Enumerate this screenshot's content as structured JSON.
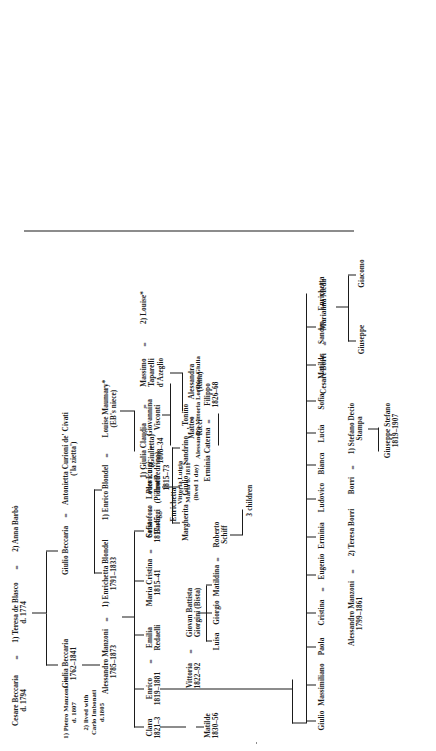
{
  "generations": {
    "g1": {
      "cesare_beccaria": "Cesare Beccaria\nd. 1794",
      "eq1": "=",
      "teresa_de_blasco": "1) Teresa de Blasco\nd. 1774",
      "eq2": "=",
      "anna_barbo": "2) Anna Barbò"
    },
    "g2": {
      "pietro_manzoni": "1) Pietro Manzoni\nd. 1807",
      "pietro_manzoni_note": "2) lived with\nCarlo Imbonati\nd.1805",
      "giulia_beccaria": "Giulia Beccaria\n1762–1841",
      "giulio_beccaria": "Giulio Beccaria",
      "eq_giulio": "=",
      "antonietta_curioni": "Antonietta Curioni de' Civati\n('la zietta')"
    },
    "g3": {
      "alessandro_manzoni": "Alessandro Manzoni\n1785–1873",
      "eq_a1": "=",
      "enrichetta_blondel": "1) Enrichetta Blondel\n1791–1833",
      "enrico_blondel": "1) Enrico Blondel",
      "eq_enrico": "=",
      "louise_maumary": "Louise Maumary*\n(EB's niece)",
      "alessandro_manzoni_2": "Alessandro Manzoni\n1799–1861",
      "eq_a2": "=",
      "teresa_borri": "2) Teresa Borri"
    },
    "g4_manzoni_children": [
      {
        "name": "Clara",
        "dates": "1821–3"
      },
      {
        "name": "Enrico",
        "dates": "1819–1881",
        "eq": "=",
        "spouse": "Emilia\nRedaelli"
      },
      {
        "name": "Maria Cristina",
        "dates": "1815–41",
        "eq": "=",
        "spouse": "Cristoforo\nBaroggi"
      },
      {
        "name": "Pier Luigi",
        "dates": "(Pietro/Pedrino)\n1815–73",
        "eq": "=",
        "spouse": "Giovannina\nVisconti"
      },
      {
        "name": "Sofia",
        "dates": "1817–45",
        "eq": "=",
        "spouse": "Lodovico\nTrotti"
      }
    ],
    "g4_other": {
      "vittoria": "Vittoria\n1822–92",
      "eq_vittoria": "=",
      "giovan_battista": "Giovan Battista\nGiorgini (Bista)",
      "matilde": "Matilde\n1830–56",
      "giulia_claudia": "1) Giulia Claudia\n(Giulietta)\n1808–34",
      "eq_giulia": "=",
      "massimo": "Massimo\nTaparelli\nd'Azeglio",
      "eq_massimo": "=",
      "louise": "2) Louise*",
      "vittoria_luigia": "Vittoria Luigia\nMaria b. 1811\n(lived 1 day)"
    },
    "g5": {
      "luisa": "Luisa",
      "giorgio": "Giorgio",
      "matildina": "Matildina",
      "eq_matildina": "=",
      "roberto_schiff": "Roberto\nSchiff",
      "three_children": "3 children",
      "erminia_caterna": "Erminia Caterna",
      "eq_filippo": "=",
      "filippo": "Filippo\n1826–68",
      "margherita": "Margherita",
      "giulio": "Giulio",
      "sandrino": "Sandrino",
      "tonino": ", Tonino",
      "enrichetta_mid": "Enrichetta",
      "alessandra_vittoria": "Alessandra Vittoria Lorenzo Giulia",
      "alessandra_rina": "Alessandra\n(Rina)",
      "matteo_ricci": "Matteo\nRicci",
      "eq_matteo": "="
    },
    "g6_enrico_children": [
      "Giulio",
      "Massimiliano",
      "Paola",
      "Cristina",
      "Erminia",
      "Ludovico",
      "Bianca",
      "Lucia",
      "Sofia",
      "Matilde",
      "Sandro",
      "Enrichetta"
    ],
    "g6_extra": {
      "eq_eugenio": "=",
      "eugenio": "Eugenio"
    },
    "borri_line": {
      "borri": "Borri",
      "eq_stefano": "=",
      "stefano_decio_stampa": "1) Stefano Decio\nStampa",
      "giuseppe_stefano": "Giuseppe Stefano\n1819–1907",
      "cesare_borri": "Cesare Borri",
      "eq_marianna": "=",
      "marianna_meda": "Marianna Meda",
      "giuseppe": "Giuseppe",
      "giacomo": "Giacomo"
    }
  },
  "colors": {
    "ink": "#1a1a1a",
    "paper": "#ffffff"
  }
}
